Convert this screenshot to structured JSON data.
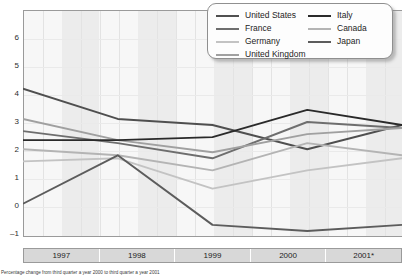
{
  "chart_data": {
    "type": "line",
    "title": "",
    "subtitle": "",
    "xlabel": "",
    "ylabel": "",
    "categories": [
      "1997",
      "1998",
      "1999",
      "2000",
      "2001*"
    ],
    "x": [
      1997,
      1998,
      1999,
      2000,
      2001
    ],
    "ylim": [
      -1,
      6.5
    ],
    "yticks": [
      6,
      5,
      4,
      3,
      2,
      1,
      0,
      -1
    ],
    "ytick_labels": [
      "6",
      "5",
      "4",
      "3",
      "2",
      "1",
      "0",
      "–1"
    ],
    "grid": true,
    "legend_position": "top-right",
    "series": [
      {
        "name": "United States",
        "color": "#4f4f4f",
        "values": [
          3.9,
          2.9,
          2.7,
          1.9,
          2.7
        ]
      },
      {
        "name": "France",
        "color": "#6e6e6e",
        "values": [
          2.5,
          2.1,
          1.6,
          2.8,
          2.6
        ]
      },
      {
        "name": "Germany",
        "color": "#c3c3c3",
        "values": [
          1.5,
          1.6,
          0.6,
          1.2,
          1.6
        ]
      },
      {
        "name": "United Kingdom",
        "color": "#a0a0a0",
        "values": [
          2.9,
          2.2,
          1.8,
          2.4,
          2.6
        ]
      },
      {
        "name": "Italy",
        "color": "#2a2a2a",
        "values": [
          2.2,
          2.2,
          2.3,
          3.2,
          2.7
        ]
      },
      {
        "name": "Canada",
        "color": "#b4b4b4",
        "values": [
          1.9,
          1.7,
          1.2,
          2.1,
          1.7
        ]
      },
      {
        "name": "Japan",
        "color": "#5c5c5c",
        "values": [
          0.1,
          1.7,
          -0.6,
          -0.8,
          -0.6
        ]
      }
    ]
  },
  "legend": {
    "column_a": [
      {
        "label": "United States",
        "color": "#4f4f4f",
        "icon": "line-swatch"
      },
      {
        "label": "France",
        "color": "#6e6e6e",
        "icon": "line-swatch"
      },
      {
        "label": "Germany",
        "color": "#c3c3c3",
        "icon": "line-swatch"
      },
      {
        "label": "United Kingdom",
        "color": "#a0a0a0",
        "icon": "line-swatch"
      }
    ],
    "column_b": [
      {
        "label": "Italy",
        "color": "#2a2a2a",
        "icon": "line-swatch"
      },
      {
        "label": "Canada",
        "color": "#b4b4b4",
        "icon": "line-swatch"
      },
      {
        "label": "Japan",
        "color": "#5c5c5c",
        "icon": "line-swatch"
      }
    ]
  },
  "footnote": {
    "text": "Percentage change from third quarter a year 2000 to third quarter a year 2001"
  }
}
